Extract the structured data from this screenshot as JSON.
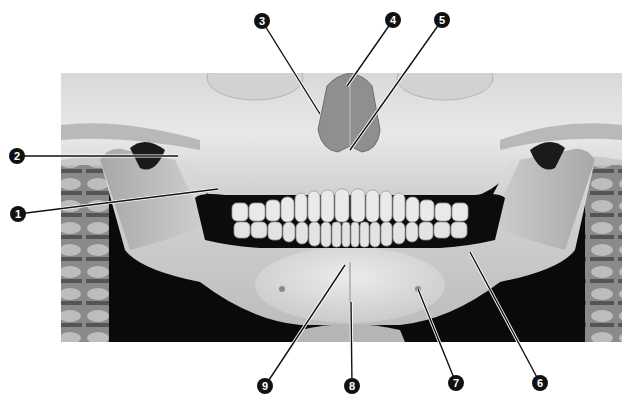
{
  "figure": {
    "photo_bounds": {
      "x": 61,
      "y": 73,
      "width": 561,
      "height": 269
    },
    "colors": {
      "background": "#ffffff",
      "bone_light": "#e6e6e6",
      "bone_mid": "#c4c4c4",
      "bone_dark": "#9a9a9a",
      "shadow": "#0a0a0a",
      "nasal": "#8f8f8f",
      "marker_fill": "#111111",
      "marker_text": "#ffffff",
      "leader_line": "#111111"
    }
  },
  "callouts": [
    {
      "id": 1,
      "label": "1",
      "marker": {
        "x": 18,
        "y": 214
      },
      "target": {
        "x": 218,
        "y": 189
      }
    },
    {
      "id": 2,
      "label": "2",
      "marker": {
        "x": 17,
        "y": 156
      },
      "target": {
        "x": 178,
        "y": 156
      }
    },
    {
      "id": 3,
      "label": "3",
      "marker": {
        "x": 262,
        "y": 21
      },
      "target": {
        "x": 320,
        "y": 114
      }
    },
    {
      "id": 4,
      "label": "4",
      "marker": {
        "x": 393,
        "y": 20
      },
      "target": {
        "x": 347,
        "y": 86
      }
    },
    {
      "id": 5,
      "label": "5",
      "marker": {
        "x": 442,
        "y": 20
      },
      "target": {
        "x": 350,
        "y": 150
      }
    },
    {
      "id": 6,
      "label": "6",
      "marker": {
        "x": 540,
        "y": 383
      },
      "target": {
        "x": 470,
        "y": 252
      }
    },
    {
      "id": 7,
      "label": "7",
      "marker": {
        "x": 456,
        "y": 383
      },
      "target": {
        "x": 418,
        "y": 289
      }
    },
    {
      "id": 8,
      "label": "8",
      "marker": {
        "x": 352,
        "y": 386
      },
      "target": {
        "x": 351,
        "y": 302
      }
    },
    {
      "id": 9,
      "label": "9",
      "marker": {
        "x": 265,
        "y": 386
      },
      "target": {
        "x": 345,
        "y": 265
      }
    }
  ]
}
